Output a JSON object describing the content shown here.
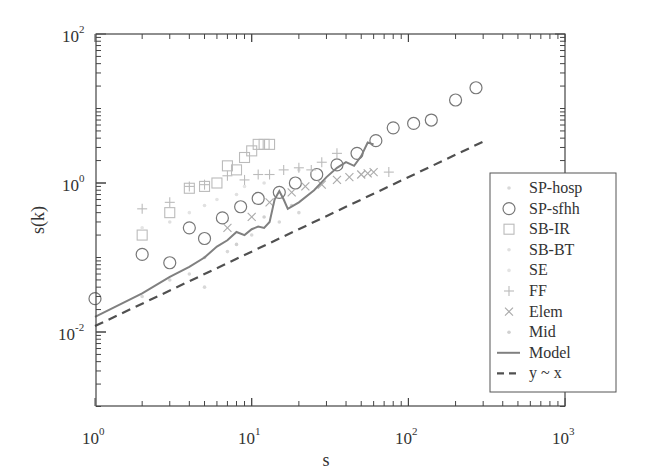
{
  "chart_data": {
    "type": "scatter",
    "title": "",
    "xlabel": "s",
    "ylabel": "s(k)",
    "xscale": "log",
    "yscale": "log",
    "xlim": [
      1,
      1000
    ],
    "ylim": [
      0.001,
      100
    ],
    "x_ticks": [
      "10^0",
      "10^1",
      "10^2",
      "10^3"
    ],
    "y_ticks": [
      "10^-2",
      "10^0",
      "10^2"
    ],
    "grid": false,
    "legend_position": "lower right",
    "series": [
      {
        "name": "SP-hosp",
        "marker": "dot",
        "color": "#d8d8d8",
        "points": [
          [
            2,
            0.03
          ],
          [
            3,
            0.05
          ],
          [
            4,
            0.06
          ],
          [
            5,
            0.04
          ],
          [
            7,
            0.12
          ],
          [
            10,
            0.2
          ],
          [
            15,
            0.3
          ],
          [
            20,
            0.4
          ]
        ]
      },
      {
        "name": "SP-sfhh",
        "marker": "circle",
        "color": "#777777",
        "points": [
          [
            1,
            0.028
          ],
          [
            2,
            0.11
          ],
          [
            3,
            0.085
          ],
          [
            4,
            0.25
          ],
          [
            5,
            0.18
          ],
          [
            6.5,
            0.34
          ],
          [
            8.5,
            0.48
          ],
          [
            11,
            0.62
          ],
          [
            15,
            0.75
          ],
          [
            19,
            1.0
          ],
          [
            26,
            1.3
          ],
          [
            35,
            1.75
          ],
          [
            47,
            2.5
          ],
          [
            62,
            3.7
          ],
          [
            80,
            5.5
          ],
          [
            108,
            6.3
          ],
          [
            140,
            7.0
          ],
          [
            200,
            13
          ],
          [
            270,
            19
          ]
        ]
      },
      {
        "name": "SB-IR",
        "marker": "square",
        "color": "#bbbbbb",
        "points": [
          [
            2,
            0.2
          ],
          [
            3,
            0.4
          ],
          [
            4,
            0.85
          ],
          [
            5,
            0.9
          ],
          [
            6,
            1.0
          ],
          [
            7,
            1.7
          ],
          [
            8,
            1.5
          ],
          [
            9,
            2.2
          ],
          [
            10,
            2.7
          ],
          [
            11,
            3.3
          ],
          [
            12,
            3.3
          ],
          [
            13,
            3.3
          ]
        ]
      },
      {
        "name": "SB-BT",
        "marker": "dot",
        "color": "#e0e0e0",
        "points": [
          [
            3,
            0.3
          ],
          [
            5,
            0.5
          ],
          [
            8,
            0.7
          ],
          [
            12,
            1.0
          ],
          [
            20,
            1.5
          ]
        ]
      },
      {
        "name": "SE",
        "marker": "dot",
        "color": "#e4e4e4",
        "points": [
          [
            2,
            0.25
          ],
          [
            4,
            0.4
          ],
          [
            6,
            0.6
          ],
          [
            9,
            0.9
          ]
        ]
      },
      {
        "name": "FF",
        "marker": "plus",
        "color": "#bbbbbb",
        "points": [
          [
            2,
            0.45
          ],
          [
            3,
            0.55
          ],
          [
            4,
            0.9
          ],
          [
            5,
            0.95
          ],
          [
            7,
            1.25
          ],
          [
            9,
            1.1
          ],
          [
            11,
            1.3
          ],
          [
            13,
            1.3
          ],
          [
            16,
            1.5
          ],
          [
            20,
            1.6
          ],
          [
            24,
            1.5
          ],
          [
            28,
            1.9
          ],
          [
            35,
            2.5
          ],
          [
            75,
            1.4
          ]
        ]
      },
      {
        "name": "Elem",
        "marker": "x",
        "color": "#aaaaaa",
        "points": [
          [
            7,
            0.25
          ],
          [
            10,
            0.35
          ],
          [
            13,
            0.55
          ],
          [
            18,
            0.75
          ],
          [
            22,
            0.9
          ],
          [
            28,
            0.95
          ],
          [
            35,
            1.1
          ],
          [
            42,
            1.2
          ],
          [
            50,
            1.3
          ],
          [
            55,
            1.35
          ],
          [
            60,
            1.4
          ]
        ]
      },
      {
        "name": "Mid",
        "marker": "dot",
        "color": "#d0d0d0",
        "points": [
          [
            5,
            0.1
          ],
          [
            8,
            0.15
          ],
          [
            12,
            0.35
          ],
          [
            18,
            0.5
          ]
        ]
      },
      {
        "name": "Model",
        "marker": "line",
        "color": "#808080",
        "points": [
          [
            1,
            0.016
          ],
          [
            2,
            0.033
          ],
          [
            3,
            0.055
          ],
          [
            4,
            0.075
          ],
          [
            5,
            0.1
          ],
          [
            6,
            0.14
          ],
          [
            7,
            0.17
          ],
          [
            8,
            0.22
          ],
          [
            9,
            0.2
          ],
          [
            10,
            0.24
          ],
          [
            11,
            0.26
          ],
          [
            12,
            0.25
          ],
          [
            13,
            0.3
          ],
          [
            14,
            0.6
          ],
          [
            15,
            0.78
          ],
          [
            16,
            0.6
          ],
          [
            17,
            0.45
          ],
          [
            20,
            0.55
          ],
          [
            25,
            0.8
          ],
          [
            30,
            1.2
          ],
          [
            35,
            1.6
          ],
          [
            40,
            1.9
          ],
          [
            45,
            1.7
          ],
          [
            50,
            2.3
          ],
          [
            55,
            3.5
          ],
          [
            60,
            3.3
          ]
        ]
      },
      {
        "name": "y ~ x",
        "marker": "dashed-line",
        "color": "#505050",
        "points": [
          [
            1,
            0.012
          ],
          [
            300,
            3.6
          ]
        ]
      }
    ]
  },
  "legend": {
    "items": [
      "SP-hosp",
      "SP-sfhh",
      "SB-IR",
      "SB-BT",
      "SE",
      "FF",
      "Elem",
      "Mid",
      "Model",
      "y ~ x"
    ]
  },
  "axes": {
    "xlabel": "s",
    "ylabel": "s(k)",
    "x_tick_base": [
      "10",
      "10",
      "10",
      "10"
    ],
    "x_tick_exp": [
      "0",
      "1",
      "2",
      "3"
    ],
    "y_tick_base": [
      "10",
      "10",
      "10"
    ],
    "y_tick_exp": [
      "2",
      "0",
      "-2"
    ]
  }
}
